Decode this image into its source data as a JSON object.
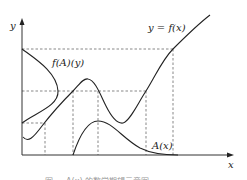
{
  "diagram": {
    "axes": {
      "x_label": "x",
      "y_label": "y"
    },
    "curves": [
      {
        "id": "f",
        "label": "y = f(x)"
      },
      {
        "id": "density_y",
        "label": "f(A)(y)"
      },
      {
        "id": "A",
        "label": "A(x)"
      }
    ],
    "caption": "图 … A(x) 的数学期望示意图",
    "colors": {
      "line": "#222222",
      "dashed": "#555555",
      "background": "#ffffff"
    }
  }
}
